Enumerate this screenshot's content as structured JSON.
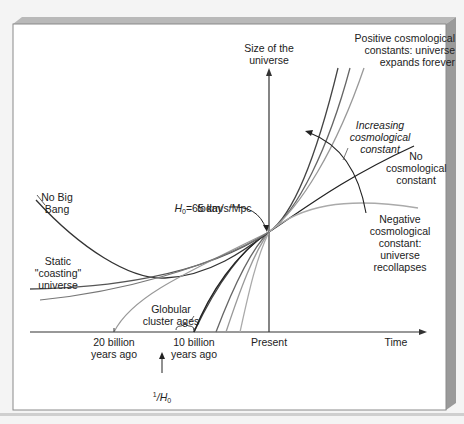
{
  "figure": {
    "y_axis_label": "Size of the\nuniverse",
    "x_axis_label": "Time",
    "x_ticks": [
      {
        "key": "twenty",
        "label": "20 billion\nyears ago"
      },
      {
        "key": "ten",
        "label": "10 billion\nyears ago"
      },
      {
        "key": "present",
        "label": "Present"
      }
    ],
    "annotations": {
      "positive": "Positive cosmological\nconstants: universe\nexpands forever",
      "increasing": "Increasing\ncosmological\nconstant",
      "no_constant": "No\ncosmological\nconstant",
      "negative": "Negative\ncosmological\nconstant:\nuniverse\nrecollapses",
      "no_big_bang": "No Big\nBang",
      "static": "Static\n\"coasting\"\nuniverse",
      "h0_symbol": "H",
      "h0_sub": "0",
      "h0_value": "=65 km/s/Mpc",
      "h0_today": "today",
      "globular": "Globular\ncluster ages",
      "inv_h0_num": "1",
      "inv_h0_sym": "/H",
      "inv_h0_sub": "0"
    },
    "curves": [
      {
        "name": "positive-curve-1",
        "description": "Positive cosmological constant (largest)",
        "color": "#444444"
      },
      {
        "name": "positive-curve-2",
        "description": "Positive cosmological constant (medium)",
        "color": "#666666"
      },
      {
        "name": "positive-curve-3",
        "description": "Positive cosmological constant (smallest)",
        "color": "#999999"
      },
      {
        "name": "no-constant-curve",
        "description": "No cosmological constant",
        "color": "#222222"
      },
      {
        "name": "negative-curve",
        "description": "Negative cosmological constant: recollapses",
        "color": "#aaaaaa"
      },
      {
        "name": "no-big-bang-curve",
        "description": "No Big Bang",
        "color": "#333333"
      },
      {
        "name": "static-coasting-curve",
        "description": "Static coasting universe",
        "color": "#555555"
      }
    ]
  }
}
